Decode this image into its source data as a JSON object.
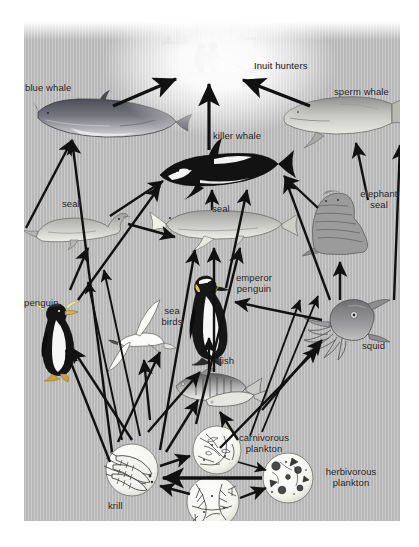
{
  "diagram": {
    "background_color": "#b7b7b7",
    "line_color": "#111111",
    "text_color": "#1a1a1a"
  },
  "labels": {
    "inuit_hunters": "Inuit hunters",
    "blue_whale": "blue whale",
    "sperm_whale": "sperm whale",
    "killer_whale": "killer whale",
    "seal_left": "seal",
    "seal_center": "seal",
    "elephant_seal": "elephant\nseal",
    "penguin": "penguin",
    "sea_birds": "sea\nbirds",
    "emperor_penguin": "emperor\npenguin",
    "squid": "squid",
    "fish": "fish",
    "krill": "krill",
    "carnivorous_plankton": "carnivorous\nplankton",
    "herbivorous_plankton": "herbivorous\nplankton",
    "phytoplankton": "phytoplankton"
  },
  "nodes": [
    {
      "id": "inuit-hunters",
      "label": "Inuit hunters",
      "x": 207,
      "y": 55
    },
    {
      "id": "blue-whale",
      "label": "blue whale",
      "x": 95,
      "y": 118
    },
    {
      "id": "sperm-whale",
      "label": "sperm whale",
      "x": 345,
      "y": 118
    },
    {
      "id": "killer-whale",
      "label": "killer whale",
      "x": 213,
      "y": 168
    },
    {
      "id": "seal-left",
      "label": "seal",
      "x": 83,
      "y": 215
    },
    {
      "id": "seal-center",
      "label": "seal",
      "x": 212,
      "y": 222
    },
    {
      "id": "elephant-seal",
      "label": "elephant seal",
      "x": 356,
      "y": 215
    },
    {
      "id": "penguin",
      "label": "penguin",
      "x": 58,
      "y": 330
    },
    {
      "id": "sea-birds",
      "label": "sea birds",
      "x": 140,
      "y": 325
    },
    {
      "id": "emperor-penguin",
      "label": "emperor penguin",
      "x": 210,
      "y": 315
    },
    {
      "id": "squid",
      "label": "squid",
      "x": 330,
      "y": 330
    },
    {
      "id": "fish",
      "label": "fish",
      "x": 212,
      "y": 375
    },
    {
      "id": "krill",
      "label": "krill",
      "x": 132,
      "y": 472
    },
    {
      "id": "carnivorous-plankton",
      "label": "carnivorous plankton",
      "x": 222,
      "y": 450
    },
    {
      "id": "herbivorous-plankton",
      "label": "herbivorous plankton",
      "x": 290,
      "y": 475
    },
    {
      "id": "phytoplankton",
      "label": "phytoplankton",
      "x": 212,
      "y": 505
    }
  ],
  "edges": [
    {
      "from": "blue-whale",
      "to": "inuit-hunters"
    },
    {
      "from": "killer-whale",
      "to": "inuit-hunters"
    },
    {
      "from": "sperm-whale",
      "to": "inuit-hunters"
    },
    {
      "from": "seal-left",
      "to": "blue-whale"
    },
    {
      "from": "seal-left",
      "to": "killer-whale"
    },
    {
      "from": "seal-left",
      "to": "seal-center"
    },
    {
      "from": "seal-center",
      "to": "killer-whale"
    },
    {
      "from": "elephant-seal",
      "to": "killer-whale"
    },
    {
      "from": "elephant-seal",
      "to": "sperm-whale"
    },
    {
      "from": "squid",
      "to": "sperm-whale"
    },
    {
      "from": "squid",
      "to": "killer-whale"
    },
    {
      "from": "squid",
      "to": "elephant-seal"
    },
    {
      "from": "squid",
      "to": "emperor-penguin"
    },
    {
      "from": "fish",
      "to": "emperor-penguin"
    },
    {
      "from": "fish",
      "to": "seal-center"
    },
    {
      "from": "fish",
      "to": "squid"
    },
    {
      "from": "fish",
      "to": "sea-birds"
    },
    {
      "from": "penguin",
      "to": "seal-left"
    },
    {
      "from": "penguin",
      "to": "killer-whale"
    },
    {
      "from": "emperor-penguin",
      "to": "killer-whale"
    },
    {
      "from": "krill",
      "to": "blue-whale"
    },
    {
      "from": "krill",
      "to": "penguin"
    },
    {
      "from": "krill",
      "to": "sea-birds"
    },
    {
      "from": "krill",
      "to": "emperor-penguin"
    },
    {
      "from": "krill",
      "to": "seal-center"
    },
    {
      "from": "krill",
      "to": "squid"
    },
    {
      "from": "krill",
      "to": "fish"
    },
    {
      "from": "krill",
      "to": "carnivorous-plankton"
    },
    {
      "from": "carnivorous-plankton",
      "to": "herbivorous-plankton"
    },
    {
      "from": "herbivorous-plankton",
      "to": "krill"
    },
    {
      "from": "phytoplankton",
      "to": "krill"
    },
    {
      "from": "phytoplankton",
      "to": "herbivorous-plankton"
    }
  ]
}
